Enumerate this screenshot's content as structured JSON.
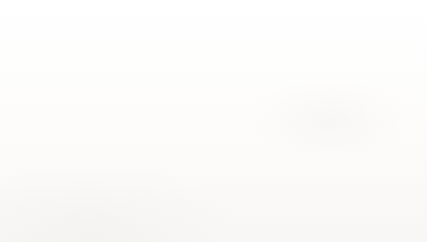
{
  "chart_data": {
    "type": "bar",
    "title": "",
    "xlabel": "",
    "ylabel": "% NISP",
    "categories": [
      "Male",
      "Female",
      "Indeterminate"
    ],
    "series": [
      {
        "name": "Trigg (n=37)",
        "values": [
          57,
          43.5,
          0
        ],
        "color": "#000000"
      }
    ],
    "ylim": [
      0,
      60
    ],
    "yticks": [
      0,
      10,
      20,
      30,
      40,
      50,
      60
    ],
    "ytick_labels": [
      "0",
      "10",
      "20",
      "30",
      "40",
      "50",
      "60"
    ],
    "grid": true,
    "grid_axis": "y",
    "legend": {
      "position": "top-right",
      "entries": [
        {
          "label": "Trigg (n=37)",
          "color": "#000000"
        }
      ]
    }
  },
  "legend": {
    "entry_label": "Trigg (n=37)"
  },
  "axes": {
    "y_title": "% NISP"
  }
}
